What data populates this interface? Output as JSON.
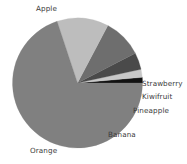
{
  "chart_data": {
    "type": "pie",
    "title": "",
    "categories": [
      "Strawberry",
      "Kiwifruit",
      "Pineapple",
      "Banana",
      "Orange",
      "Apple"
    ],
    "values": [
      1.4,
      2.0,
      4.2,
      9.7,
      12.8,
      70.0
    ],
    "labels": [
      "Strawberry",
      "Kiwifruit",
      "Pineapple",
      "Banana",
      "Orange",
      "Apple"
    ],
    "colors": [
      "#121212",
      "#c8c8c8",
      "#4a4a4a",
      "#6e6e6e",
      "#bdbdbd",
      "#808080"
    ],
    "legend": "none",
    "grid": false,
    "start_angle": 0,
    "direction": "counterclockwise",
    "slices": [
      {
        "name": "Strawberry",
        "value": 1.4,
        "color": "#121212",
        "start_deg": 0.0,
        "end_deg": 5.0
      },
      {
        "name": "Kiwifruit",
        "value": 2.0,
        "color": "#c8c8c8",
        "start_deg": 5.0,
        "end_deg": 12.2
      },
      {
        "name": "Pineapple",
        "value": 4.2,
        "color": "#4a4a4a",
        "start_deg": 12.2,
        "end_deg": 27.3
      },
      {
        "name": "Banana",
        "value": 9.7,
        "color": "#6e6e6e",
        "start_deg": 27.3,
        "end_deg": 62.2
      },
      {
        "name": "Orange",
        "value": 12.8,
        "color": "#bdbdbd",
        "start_deg": 62.2,
        "end_deg": 108.3
      },
      {
        "name": "Apple",
        "value": 70.0,
        "color": "#808080",
        "start_deg": 108.3,
        "end_deg": 360.0
      }
    ],
    "geometry": {
      "cx": 77.5,
      "cy": 83.0,
      "r": 65.0
    }
  },
  "labels": {
    "apple": "Apple",
    "orange": "Orange",
    "banana": "Banana",
    "pineapple": "Pineapple",
    "kiwifruit": "Kiwifruit",
    "strawberry": "Strawberry"
  }
}
